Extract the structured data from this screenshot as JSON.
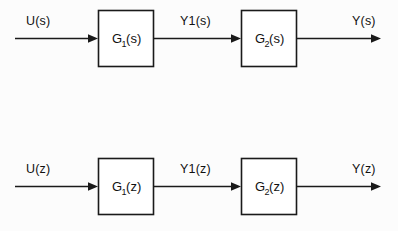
{
  "figure": {
    "kind": "block-diagram",
    "background_color": "#fcfcfc",
    "line_color": "#1a1a1a",
    "block_fill": "#ffffff"
  },
  "diagrams": [
    {
      "id": "continuous-time",
      "domain_variable": "s",
      "input_label": "U(s)",
      "intermediate_label": "Y1(s)",
      "output_label": "Y(s)",
      "blocks": [
        {
          "id": "block-g1-s",
          "base": "G",
          "subscript": "1",
          "argument": "(s)",
          "full_label": "G1(s)"
        },
        {
          "id": "block-g2-s",
          "base": "G",
          "subscript": "2",
          "argument": "(s)",
          "full_label": "G2(s)"
        }
      ]
    },
    {
      "id": "discrete-time",
      "domain_variable": "z",
      "input_label": "U(z)",
      "intermediate_label": "Y1(z)",
      "output_label": "Y(z)",
      "blocks": [
        {
          "id": "block-g1-z",
          "base": "G",
          "subscript": "1",
          "argument": "(z)",
          "full_label": "G1(z)"
        },
        {
          "id": "block-g2-z",
          "base": "G",
          "subscript": "2",
          "argument": "(z)",
          "full_label": "G2(z)"
        }
      ]
    }
  ]
}
